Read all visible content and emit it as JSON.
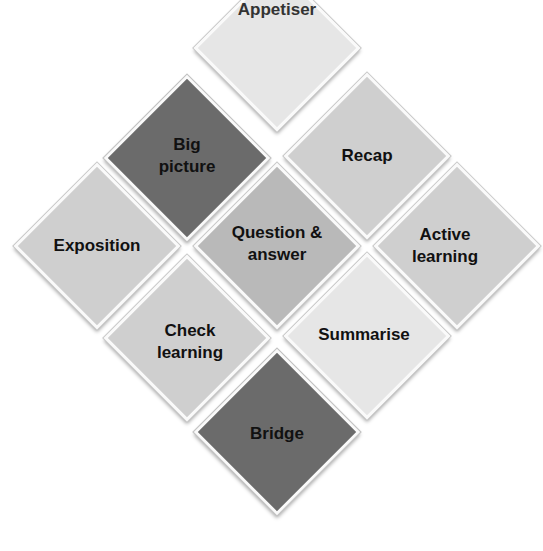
{
  "diagram": {
    "title": "",
    "nodes": [
      {
        "id": "appetiser",
        "label": "Appetiser",
        "shade": "pale"
      },
      {
        "id": "big-picture",
        "label": "Big\npicture",
        "shade": "dark"
      },
      {
        "id": "recap",
        "label": "Recap",
        "shade": "light"
      },
      {
        "id": "exposition",
        "label": "Exposition",
        "shade": "light"
      },
      {
        "id": "question-answer",
        "label": "Question &\nanswer",
        "shade": "mid"
      },
      {
        "id": "active-learning",
        "label": "Active\nlearning",
        "shade": "light"
      },
      {
        "id": "check-learning",
        "label": "Check\nlearning",
        "shade": "light"
      },
      {
        "id": "summarise",
        "label": "Summarise",
        "shade": "light"
      },
      {
        "id": "bridge",
        "label": "Bridge",
        "shade": "dark"
      }
    ],
    "labels": {
      "appetiser": "Appetiser",
      "big_picture_1": "Big",
      "big_picture_2": "picture",
      "recap": "Recap",
      "exposition": "Exposition",
      "qa_1": "Question &",
      "qa_2": "answer",
      "active_1": "Active",
      "active_2": "learning",
      "check_1": "Check",
      "check_2": "learning",
      "summarise": "Summarise",
      "bridge": "Bridge"
    },
    "colors": {
      "dark": "#6b6b6b",
      "mid": "#b9b9b9",
      "light": "#cfcfcf",
      "pale": "#e6e6e6",
      "border": "#fafafa"
    }
  }
}
